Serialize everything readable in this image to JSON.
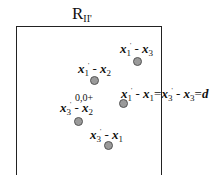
{
  "title": {
    "main": "R",
    "sub": "II'"
  },
  "points": [
    {
      "id": "x1p-x3",
      "a": "x",
      "a_sub": "1",
      "b": "x",
      "b_sub": "3",
      "op": " - "
    },
    {
      "id": "x1p-x2",
      "a": "x",
      "a_sub": "1",
      "b": "x",
      "b_sub": "2",
      "op": " - "
    },
    {
      "id": "x3p-x2",
      "a": "x",
      "a_sub": "3",
      "b": "x",
      "b_sub": "2",
      "op": " - "
    },
    {
      "id": "x3p-x1",
      "a": "x",
      "a_sub": "3",
      "b": "x",
      "b_sub": "1",
      "op": " - "
    }
  ],
  "equation": {
    "lhs_a_sub": "1",
    "lhs_b_sub": "1",
    "rhs_a_sub": "3",
    "rhs_b_sub": "3",
    "eq": "=",
    "d": "d"
  },
  "origin_label": "0,0",
  "prime": "'"
}
